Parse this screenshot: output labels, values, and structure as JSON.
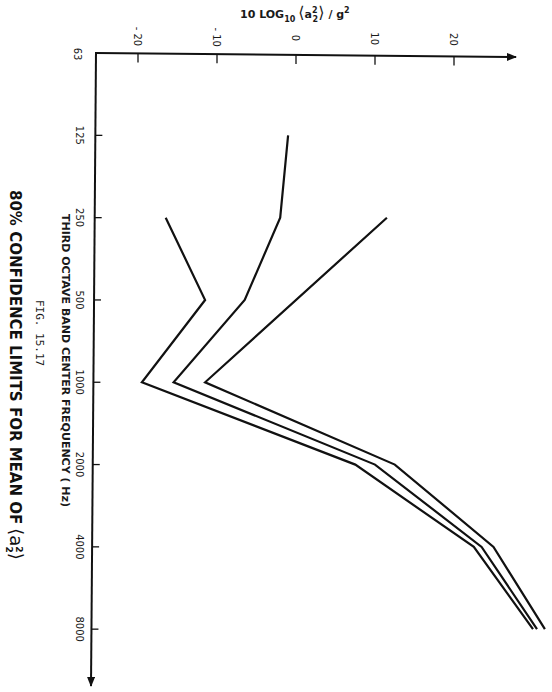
{
  "chart_data": {
    "type": "line",
    "orientation": "rotated 90° clockwise (frequency runs top-to-bottom, level runs left-to-right)",
    "figure_label": "FIG. 15.17",
    "xlabel": "THIRD OCTAVE BAND CENTER FREQUENCY (Hz)",
    "ylabel": "10 LOG10 <a2^2> / g^2",
    "x_ticks": [
      "63",
      "125",
      "250",
      "500",
      "1000",
      "2000",
      "4000",
      "8000"
    ],
    "y_ticks": [
      -20,
      -10,
      0,
      10,
      20
    ],
    "ylim": [
      -25,
      32
    ],
    "x_scale": "log2 (octave bands)",
    "grid": false,
    "series": [
      {
        "name": "Lower 80% confidence limit",
        "x": [
          250,
          500,
          1000,
          2000,
          4000,
          8000
        ],
        "values": [
          -16.5,
          -11.5,
          -19.5,
          7.5,
          22.5,
          30
        ]
      },
      {
        "name": "Mean",
        "x": [
          125,
          250,
          500,
          1000,
          2000,
          4000,
          8000
        ],
        "values": [
          -1,
          -2,
          -6.5,
          -15.5,
          10,
          23.5,
          30.5
        ]
      },
      {
        "name": "Upper 80% confidence limit",
        "x": [
          250,
          1000,
          2000,
          4000,
          8000
        ],
        "values": [
          11.5,
          -11.5,
          12.5,
          25,
          31.5
        ]
      }
    ]
  },
  "labels": {
    "ylabel_text": "10 LOG",
    "ylabel_sub": "10",
    "ylabel_bracket_open": "⟨",
    "ylabel_var": "a",
    "ylabel_var_sup": "2",
    "ylabel_var_sub": "2",
    "ylabel_bracket_close": "⟩",
    "ylabel_slash_g": "/ g",
    "ylabel_g_sup": "2",
    "xlabel_text": "THIRD OCTAVE BAND CENTER FREQUENCY ( Hz)",
    "fig_text": "FIG. 15.17",
    "title_text": "80% CONFIDENCE LIMITS FOR MEAN OF",
    "title_var": "⟨a",
    "title_var_sup": "2",
    "title_var_sub": "2",
    "title_close": "⟩",
    "y_tick_labels": [
      "- 20",
      "- 10",
      "0",
      "10",
      "20"
    ],
    "x_tick_labels": [
      "63",
      "125",
      "250",
      "500",
      "1000",
      "2000",
      "4000",
      "8000"
    ]
  },
  "colors": {
    "ink": "#111111",
    "paper": "#ffffff"
  }
}
